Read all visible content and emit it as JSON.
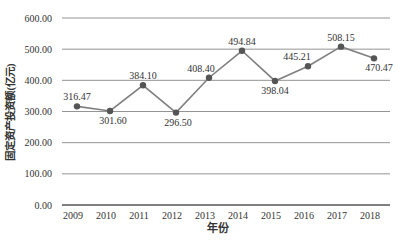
{
  "chart_data": {
    "type": "line",
    "title": "",
    "xlabel": "年份",
    "ylabel": "固定资产投资额(亿元)",
    "categories": [
      "2009",
      "2010",
      "2011",
      "2012",
      "2013",
      "2014",
      "2015",
      "2016",
      "2017",
      "2018"
    ],
    "values": [
      316.47,
      301.6,
      384.1,
      296.5,
      408.4,
      494.84,
      398.04,
      445.21,
      508.15,
      470.47
    ],
    "data_labels": [
      "316.47",
      "301.60",
      "384.10",
      "296.50",
      "408.40",
      "494.84",
      "398.04",
      "445.21",
      "508.15",
      "470.47"
    ],
    "ylim": [
      0,
      600
    ],
    "yticks": [
      "0.00",
      "100.00",
      "200.00",
      "300.00",
      "400.00",
      "500.00",
      "600.00"
    ],
    "grid": true,
    "legend": "none",
    "colors": {
      "line": "#808080",
      "marker": "#555555",
      "grid": "#888888"
    }
  }
}
